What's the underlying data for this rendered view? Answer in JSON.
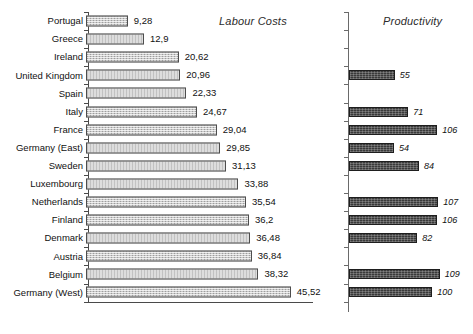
{
  "chart_data": {
    "type": "bar",
    "title": "",
    "orientation": "horizontal",
    "panels": [
      {
        "name": "labour",
        "title": "Labour Costs",
        "xlabel": "",
        "ylabel": "",
        "xlim": [
          0,
          50
        ],
        "xticks": [
          0,
          10,
          20,
          30,
          40,
          50
        ],
        "grid": false,
        "legend": "none"
      },
      {
        "name": "productivity",
        "title": "Productivity",
        "xlabel": "",
        "ylabel": "",
        "xlim": [
          0,
          120
        ],
        "xticks": [],
        "grid": false,
        "legend": "none"
      }
    ],
    "categories": [
      "Portugal",
      "Greece",
      "Ireland",
      "United Kingdom",
      "Spain",
      "Italy",
      "France",
      "Germany (East)",
      "Sweden",
      "Luxembourg",
      "Netherlands",
      "Finland",
      "Denmark",
      "Austria",
      "Belgium",
      "Germany (West)"
    ],
    "series": [
      {
        "name": "Labour Costs",
        "panel": "labour",
        "values": [
          9.28,
          12.9,
          20.62,
          20.96,
          22.33,
          24.67,
          29.04,
          29.85,
          31.13,
          33.88,
          35.54,
          36.2,
          36.48,
          36.84,
          38.32,
          45.52
        ],
        "labels": [
          "9,28",
          "12,9",
          "20,62",
          "20,96",
          "22,33",
          "24,67",
          "29,04",
          "29,85",
          "31,13",
          "33,88",
          "35,54",
          "36,2",
          "36,48",
          "36,84",
          "38,32",
          "45,52"
        ]
      },
      {
        "name": "Productivity",
        "panel": "productivity",
        "values": [
          null,
          null,
          null,
          55,
          null,
          71,
          106,
          54,
          84,
          null,
          107,
          106,
          82,
          null,
          109,
          100
        ],
        "labels": [
          "",
          "",
          "",
          "55",
          "",
          "71",
          "106",
          "54",
          "84",
          "",
          "107",
          "106",
          "82",
          "",
          "109",
          "100"
        ]
      }
    ],
    "xticklabels": [
      "0",
      "10",
      "20",
      "30",
      "40",
      "50"
    ],
    "colors": {
      "labour_bar_fill": "#c9c9c9",
      "labour_bar_border": "#4d4d4d",
      "productivity_bar_fill": "#3a3a3a",
      "productivity_bar_border": "#1e1e1e",
      "axis": "#4a4a4a",
      "text": "#111111",
      "background": "#ffffff"
    }
  }
}
